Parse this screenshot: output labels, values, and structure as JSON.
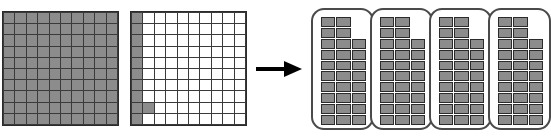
{
  "diagram": {
    "type": "area-model-division",
    "background_color": "#ffffff",
    "shaded_color": "#8c8c8c",
    "gridline_color": "#2b2b2b",
    "outline_color": "#4a4a4a",
    "arrow_color": "#000000"
  },
  "grid_full": {
    "label": "fully-shaded-hundred-square",
    "rows": 10,
    "columns": 10,
    "total_cells": 100,
    "shaded_count": 100,
    "shaded_cells": [
      [
        1,
        1
      ],
      [
        1,
        2
      ],
      [
        1,
        3
      ],
      [
        1,
        4
      ],
      [
        1,
        5
      ],
      [
        1,
        6
      ],
      [
        1,
        7
      ],
      [
        1,
        8
      ],
      [
        1,
        9
      ],
      [
        1,
        10
      ],
      [
        2,
        1
      ],
      [
        2,
        2
      ],
      [
        2,
        3
      ],
      [
        2,
        4
      ],
      [
        2,
        5
      ],
      [
        2,
        6
      ],
      [
        2,
        7
      ],
      [
        2,
        8
      ],
      [
        2,
        9
      ],
      [
        2,
        10
      ],
      [
        3,
        1
      ],
      [
        3,
        2
      ],
      [
        3,
        3
      ],
      [
        3,
        4
      ],
      [
        3,
        5
      ],
      [
        3,
        6
      ],
      [
        3,
        7
      ],
      [
        3,
        8
      ],
      [
        3,
        9
      ],
      [
        3,
        10
      ],
      [
        4,
        1
      ],
      [
        4,
        2
      ],
      [
        4,
        3
      ],
      [
        4,
        4
      ],
      [
        4,
        5
      ],
      [
        4,
        6
      ],
      [
        4,
        7
      ],
      [
        4,
        8
      ],
      [
        4,
        9
      ],
      [
        4,
        10
      ],
      [
        5,
        1
      ],
      [
        5,
        2
      ],
      [
        5,
        3
      ],
      [
        5,
        4
      ],
      [
        5,
        5
      ],
      [
        5,
        6
      ],
      [
        5,
        7
      ],
      [
        5,
        8
      ],
      [
        5,
        9
      ],
      [
        5,
        10
      ],
      [
        6,
        1
      ],
      [
        6,
        2
      ],
      [
        6,
        3
      ],
      [
        6,
        4
      ],
      [
        6,
        5
      ],
      [
        6,
        6
      ],
      [
        6,
        7
      ],
      [
        6,
        8
      ],
      [
        6,
        9
      ],
      [
        6,
        10
      ],
      [
        7,
        1
      ],
      [
        7,
        2
      ],
      [
        7,
        3
      ],
      [
        7,
        4
      ],
      [
        7,
        5
      ],
      [
        7,
        6
      ],
      [
        7,
        7
      ],
      [
        7,
        8
      ],
      [
        7,
        9
      ],
      [
        7,
        10
      ],
      [
        8,
        1
      ],
      [
        8,
        2
      ],
      [
        8,
        3
      ],
      [
        8,
        4
      ],
      [
        8,
        5
      ],
      [
        8,
        6
      ],
      [
        8,
        7
      ],
      [
        8,
        8
      ],
      [
        8,
        9
      ],
      [
        8,
        10
      ],
      [
        9,
        1
      ],
      [
        9,
        2
      ],
      [
        9,
        3
      ],
      [
        9,
        4
      ],
      [
        9,
        5
      ],
      [
        9,
        6
      ],
      [
        9,
        7
      ],
      [
        9,
        8
      ],
      [
        9,
        9
      ],
      [
        9,
        10
      ],
      [
        10,
        1
      ],
      [
        10,
        2
      ],
      [
        10,
        3
      ],
      [
        10,
        4
      ],
      [
        10,
        5
      ],
      [
        10,
        6
      ],
      [
        10,
        7
      ],
      [
        10,
        8
      ],
      [
        10,
        9
      ],
      [
        10,
        10
      ]
    ]
  },
  "grid_partial": {
    "label": "partially-shaded-hundred-square",
    "rows": 10,
    "columns": 10,
    "total_cells": 100,
    "shaded_count": 11,
    "shaded_cells": [
      [
        1,
        1
      ],
      [
        2,
        1
      ],
      [
        3,
        1
      ],
      [
        4,
        1
      ],
      [
        5,
        1
      ],
      [
        6,
        1
      ],
      [
        7,
        1
      ],
      [
        8,
        1
      ],
      [
        9,
        1
      ],
      [
        10,
        1
      ],
      [
        9,
        2
      ]
    ]
  },
  "arrow": {
    "label": "right-arrow",
    "direction": "right"
  },
  "groups": [
    {
      "label": "group-1",
      "rows": 10,
      "columns": 3,
      "shaded_count": 28,
      "column_heights": [
        10,
        10,
        8
      ],
      "column_offsets": [
        0,
        0,
        2
      ]
    },
    {
      "label": "group-2",
      "rows": 10,
      "columns": 3,
      "shaded_count": 28,
      "column_heights": [
        10,
        10,
        8
      ],
      "column_offsets": [
        0,
        0,
        2
      ]
    },
    {
      "label": "group-3",
      "rows": 10,
      "columns": 3,
      "shaded_count": 28,
      "column_heights": [
        10,
        10,
        8
      ],
      "column_offsets": [
        0,
        0,
        2
      ]
    },
    {
      "label": "group-4",
      "rows": 10,
      "columns": 3,
      "shaded_count": 28,
      "column_heights": [
        10,
        10,
        8
      ],
      "column_offsets": [
        0,
        0,
        2
      ]
    }
  ],
  "caption_strip": {
    "text": ""
  }
}
